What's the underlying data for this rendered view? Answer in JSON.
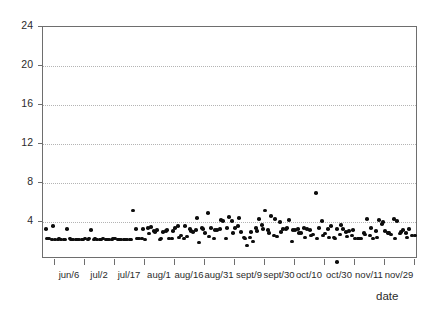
{
  "chart_data": {
    "type": "scatter",
    "title": "",
    "xlabel": "date",
    "ylabel": "",
    "ylim": [
      1.4,
      24
    ],
    "grid": true,
    "legend": null,
    "y_ticks": [
      24,
      20,
      16,
      12,
      8,
      4
    ],
    "y_tick_labels": [
      "24",
      "20",
      "16",
      "12",
      "8",
      "4"
    ],
    "gridline_values": [
      20,
      16,
      12,
      8,
      4
    ],
    "x_tick_labels": [
      "jun/6",
      "jul/2",
      "jul/17",
      "aug/1",
      "aug/16",
      "aug/31",
      "sept/9",
      "sept/30",
      "oct/10",
      "oct/30",
      "nov/11",
      "nov/29"
    ],
    "x_tick_positions": [
      54,
      84,
      114,
      144,
      174,
      204,
      234,
      264,
      294,
      324,
      354,
      384,
      414
    ],
    "point_color": "#0d0d0d",
    "axis_color": "#6e6e6e",
    "gridline_color": "#b4b4b4",
    "background_color": "#ffffff",
    "n_points": 186,
    "x": [
      45,
      48,
      51,
      54,
      57,
      60,
      63,
      66,
      69,
      72,
      75,
      78,
      81,
      84,
      87,
      90,
      93,
      96,
      99,
      102,
      105,
      108,
      111,
      114,
      117,
      120,
      123,
      126,
      129,
      132,
      135,
      138,
      141,
      144,
      147,
      150,
      153,
      156,
      159,
      162,
      165,
      168,
      171,
      174,
      177,
      180,
      183,
      186,
      189,
      192,
      195,
      198,
      201,
      204,
      207,
      210,
      213,
      216,
      219,
      222,
      225,
      228,
      231,
      234,
      237,
      240,
      243,
      246,
      249,
      252,
      255,
      258,
      261,
      264,
      267,
      270,
      273,
      276,
      279,
      282,
      285,
      288,
      291,
      294,
      297,
      300,
      303,
      306,
      309,
      312,
      315,
      318,
      321,
      324,
      327,
      330,
      333,
      336,
      339,
      342,
      345,
      348,
      351,
      354,
      357,
      360,
      363,
      366,
      369,
      372,
      375,
      378,
      381,
      384,
      387,
      390,
      393,
      396,
      399,
      402,
      405,
      408,
      411,
      414,
      46,
      52,
      58,
      64,
      70,
      76,
      82,
      88,
      94,
      100,
      106,
      112,
      118,
      124,
      130,
      136,
      142,
      148,
      154,
      160,
      166,
      172,
      178,
      184,
      190,
      196,
      202,
      208,
      214,
      220,
      226,
      232,
      238,
      244,
      250,
      256,
      262,
      268,
      274,
      280,
      286,
      292,
      298,
      304,
      310,
      316,
      322,
      328,
      334,
      340,
      346,
      352,
      358,
      364,
      370,
      376,
      382,
      388,
      394,
      400,
      406,
      412
    ],
    "y": [
      3.3,
      2.3,
      2.2,
      2.2,
      2.2,
      2.2,
      2.2,
      3.3,
      2.3,
      2.2,
      2.2,
      2.2,
      2.2,
      2.3,
      2.2,
      3.2,
      2.2,
      2.2,
      2.2,
      2.3,
      2.2,
      2.2,
      2.2,
      2.3,
      2.2,
      2.2,
      2.2,
      2.2,
      2.2,
      5.2,
      3.3,
      2.3,
      2.3,
      2.2,
      3.4,
      3.5,
      3.1,
      3.2,
      2.2,
      3.0,
      3.1,
      2.3,
      2.3,
      3.4,
      3.6,
      2.6,
      2.3,
      2.5,
      3.3,
      3.0,
      3.2,
      1.9,
      3.4,
      2.9,
      4.9,
      3.4,
      2.3,
      3.2,
      3.3,
      4.1,
      2.3,
      4.5,
      4.1,
      3.4,
      3.6,
      3.0,
      2.4,
      1.6,
      2.4,
      2.0,
      3.4,
      4.3,
      3.7,
      5.2,
      3.2,
      4.6,
      2.6,
      2.5,
      4.0,
      3.3,
      3.3,
      4.2,
      2.0,
      3.2,
      3.3,
      2.9,
      3.4,
      3.3,
      3.2,
      2.7,
      7.0,
      3.4,
      4.1,
      2.8,
      3.3,
      3.6,
      2.4,
      3.3,
      2.7,
      3.3,
      3.0,
      3.1,
      2.6,
      2.3,
      2.3,
      2.3,
      2.9,
      4.3,
      2.6,
      2.3,
      3.1,
      4.2,
      3.8,
      3.1,
      2.9,
      2.7,
      4.3,
      4.1,
      2.8,
      3.2,
      2.9,
      3.3,
      2.6,
      2.6,
      2.3,
      3.6,
      2.3,
      2.2,
      2.2,
      2.2,
      2.2,
      2.3,
      2.3,
      2.2,
      2.2,
      2.3,
      2.2,
      2.2,
      2.2,
      2.3,
      3.3,
      2.8,
      3.0,
      2.3,
      3.2,
      3.1,
      2.4,
      3.6,
      3.1,
      4.4,
      3.3,
      2.5,
      3.2,
      4.2,
      3.4,
      2.9,
      4.4,
      2.3,
      3.0,
      3.1,
      3.3,
      2.9,
      4.3,
      3.0,
      3.4,
      3.2,
      2.9,
      2.4,
      2.6,
      2.3,
      2.6,
      2.4,
      2.3,
      3.7,
      2.5,
      3.2,
      2.3,
      2.7,
      3.4,
      2.4,
      4.0,
      2.9,
      2.3,
      3.0,
      2.4
    ],
    "outliers_below_axis": [
      {
        "x": 337,
        "note": "point rendered below baseline near oct/30"
      }
    ]
  }
}
